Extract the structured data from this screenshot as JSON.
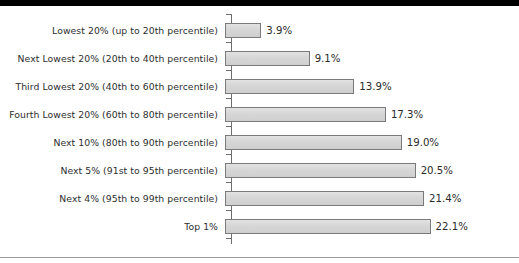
{
  "chart_data": {
    "type": "bar",
    "orientation": "horizontal",
    "title": "",
    "subtitle": "",
    "xlabel": "",
    "ylabel": "",
    "grid": false,
    "legend": null,
    "axis_range": [
      0,
      25
    ],
    "value_suffix": "%",
    "categories": [
      "Lowest 20% (up to 20th percentile)",
      "Next Lowest 20% (20th to 40th percentile)",
      "Third Lowest 20% (40th to 60th percentile)",
      "Fourth Lowest 20% (60th to 80th percentile)",
      "Next 10% (80th to 90th percentile)",
      "Next 5% (91st to 95th percentile)",
      "Next 4% (95th to 99th percentile)",
      "Top 1%"
    ],
    "values": [
      3.9,
      9.1,
      13.9,
      17.3,
      19.0,
      20.5,
      21.4,
      22.1
    ],
    "value_labels": [
      "3.9%",
      "9.1%",
      "13.9%",
      "17.3%",
      "19.0%",
      "20.5%",
      "21.4%",
      "22.1%"
    ],
    "colors": {
      "bar_fill": "#d9d9d9",
      "bar_border": "#7a7a7a",
      "axis": "#6e6e6e",
      "label_text": "#2e2e2e",
      "value_text": "#2b2b2b",
      "top_rule": "#000000",
      "bottom_rule": "#9a9a9a",
      "background": "#ffffff"
    }
  }
}
